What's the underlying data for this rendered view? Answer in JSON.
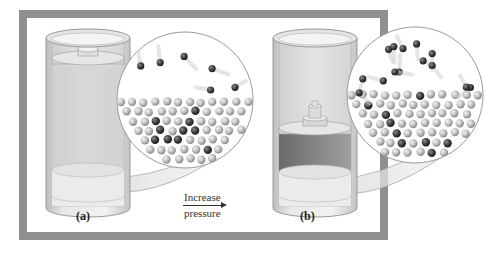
{
  "figure": {
    "frame": {
      "x": 19,
      "y": 10,
      "width": 369,
      "height": 230,
      "thickness": 8,
      "color": "#8f8f8f"
    },
    "colors": {
      "cylinder_wall": "#d9d9d9",
      "cylinder_edge": "#9a9a9a",
      "cylinder_inner": "#ececec",
      "liquid": "#c8c8c8",
      "gas_dark": "#707070",
      "piston": "#cfcfcf",
      "molecule_light": "#bdbdbd",
      "molecule_dark": "#3e3e3e",
      "magnifier_stroke": "#9a9a9a",
      "magnifier_fill": "#ffffff"
    },
    "arrow": {
      "top_text": "Increase",
      "bottom_text": "pressure",
      "direction": "right"
    },
    "panels": [
      {
        "id": "a",
        "label": "(a)",
        "description": "Cylinder with liquid and gas at equilibrium; piston resting high",
        "cylinder": {
          "x": 46,
          "y": 38,
          "width": 84,
          "height": 170
        },
        "piston_y": 58,
        "liquid_top_y": 170,
        "magnifier": {
          "cx": 185,
          "cy": 100,
          "r": 68
        },
        "gas_molecules": 6,
        "liquid_molecules": 45
      },
      {
        "id": "b",
        "label": "(b)",
        "description": "Cylinder after pressure increased; piston pushed down with weight, more gas molecules dissolve",
        "cylinder": {
          "x": 273,
          "y": 38,
          "width": 84,
          "height": 170
        },
        "piston_y": 128,
        "liquid_top_y": 172,
        "magnifier": {
          "cx": 415,
          "cy": 95,
          "r": 68
        },
        "gas_molecules": 14,
        "liquid_molecules": 55
      }
    ]
  }
}
